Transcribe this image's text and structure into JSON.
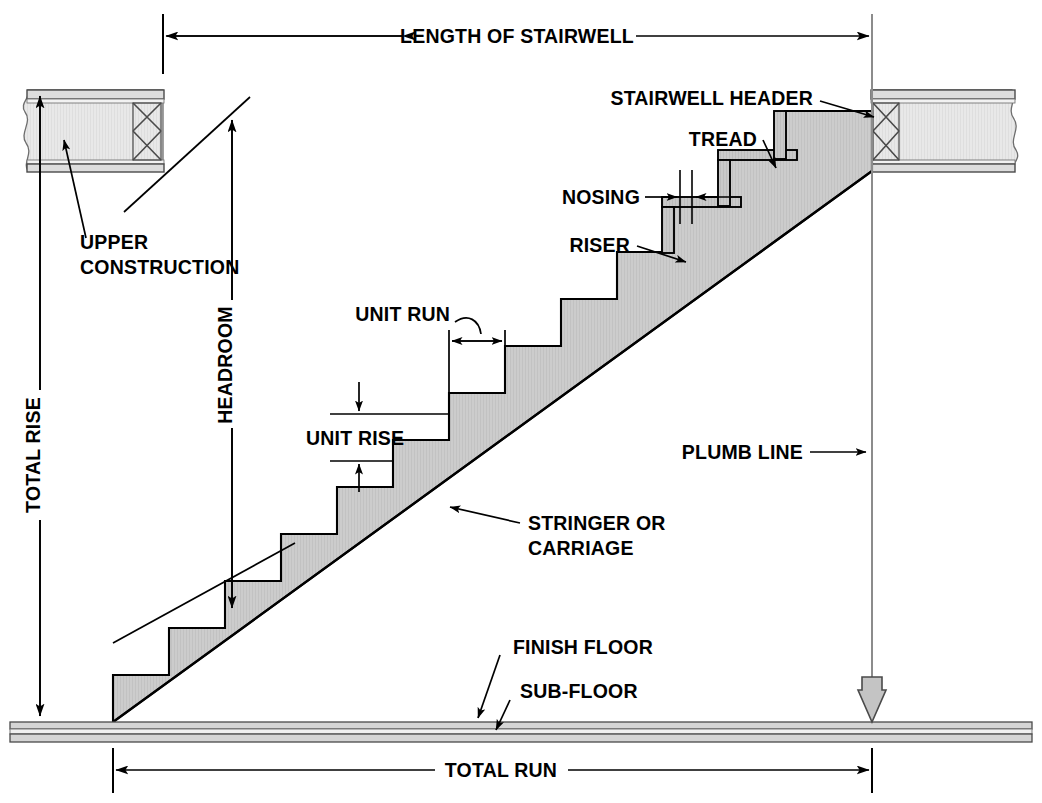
{
  "diagram": {
    "type": "architectural-section",
    "colors": {
      "line": "#000000",
      "fill_stair": "#cccccc",
      "fill_construction": "#e6e6e6",
      "fill_tread": "#c9c9c9",
      "plumb_line": "#8c8c8c",
      "background": "#ffffff"
    },
    "labels": {
      "length_of_stairwell": "LENGTH OF STAIRWELL",
      "stairwell_header": "STAIRWELL HEADER",
      "tread": "TREAD",
      "nosing": "NOSING",
      "riser": "RISER",
      "upper_construction_line1": "UPPER",
      "upper_construction_line2": "CONSTRUCTION",
      "headroom": "HEADROOM",
      "total_rise": "TOTAL RISE",
      "unit_run": "UNIT RUN",
      "unit_rise": "UNIT RISE",
      "plumb_line": "PLUMB LINE",
      "stringer_line1": "STRINGER OR",
      "stringer_line2": "CARRIAGE",
      "finish_floor": "FINISH FLOOR",
      "sub_floor": "SUB-FLOOR",
      "total_run": "TOTAL RUN"
    },
    "geometry": {
      "riser_count": 13,
      "unit_rise_px": 47,
      "unit_run_px": 56,
      "stair_base_x": 113,
      "floor_top_y": 722,
      "stairwell_left_x": 163,
      "stairwell_right_x": 872,
      "total_run_left_x": 113,
      "total_run_right_x": 872,
      "total_rise_x": 40,
      "headroom_x": 232,
      "plumb_line_x": 872
    }
  }
}
